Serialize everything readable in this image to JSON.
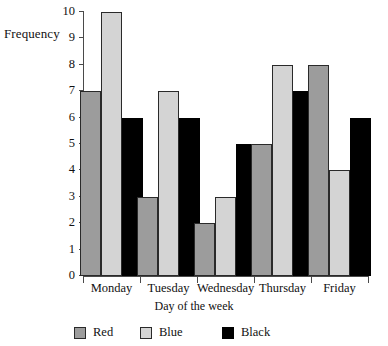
{
  "chart_data": {
    "type": "bar",
    "title": "",
    "xlabel": "Day of the week",
    "ylabel": "Frequency",
    "categories": [
      "Monday",
      "Tuesday",
      "Wednesday",
      "Thursday",
      "Friday"
    ],
    "series": [
      {
        "name": "Red",
        "color": "#9c9c9c",
        "values": [
          7,
          3,
          2,
          5,
          8
        ]
      },
      {
        "name": "Blue",
        "color": "#d4d4d4",
        "values": [
          10,
          7,
          3,
          8,
          4
        ]
      },
      {
        "name": "Black",
        "color": "#000000",
        "values": [
          6,
          6,
          5,
          7,
          6
        ]
      }
    ],
    "ylim": [
      0,
      10
    ],
    "ytick_labels": [
      "0",
      "1",
      "2",
      "3",
      "4",
      "5",
      "6",
      "7",
      "8",
      "9",
      "10"
    ],
    "grid": false,
    "legend_position": "bottom"
  },
  "axes": {
    "y_title": "Frequency",
    "x_title": "Day of the week"
  },
  "legend": {
    "items": [
      {
        "label": "Red"
      },
      {
        "label": "Blue"
      },
      {
        "label": "Black"
      }
    ]
  },
  "colors": {
    "red_series": "#9c9c9c",
    "blue_series": "#d4d4d4",
    "black_series": "#000000",
    "axis": "#4a4a4a",
    "background": "#ffffff"
  }
}
